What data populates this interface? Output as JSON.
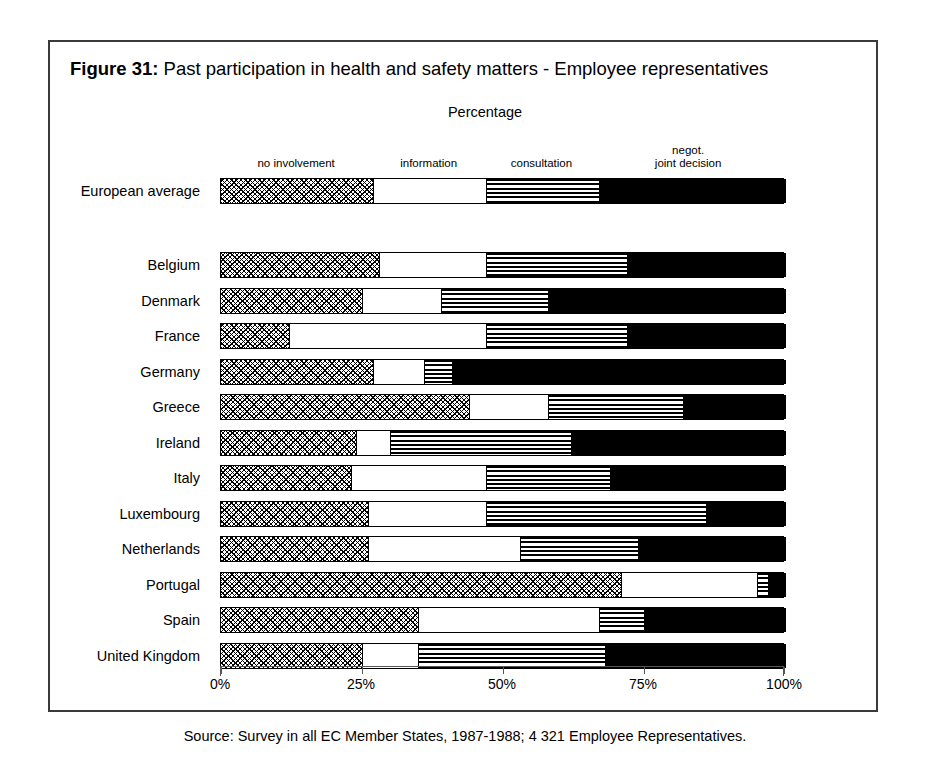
{
  "figure": {
    "number_label": "Figure 31:",
    "title": "Past participation in health and safety matters - Employee representatives",
    "axis_caption": "Percentage",
    "source": "Source: Survey in all EC Member States, 1987-1988; 4 321 Employee Representatives."
  },
  "chart_data": {
    "type": "bar",
    "orientation": "horizontal",
    "stacked": true,
    "title": "Figure 31: Past participation in health and safety matters - Employee representatives",
    "xlabel": "Percentage",
    "ylabel": "",
    "xlim": [
      0,
      100
    ],
    "grid": false,
    "legend_position": "top",
    "tick_labels": [
      "0%",
      "25%",
      "50%",
      "75%",
      "100%"
    ],
    "ticks": [
      0,
      25,
      50,
      75,
      100
    ],
    "series": [
      {
        "name": "no involvement",
        "pattern": "pat-dots",
        "label_lines": [
          "no involvement"
        ],
        "label_at": 13.5
      },
      {
        "name": "information",
        "pattern": "pat-white",
        "label_lines": [
          "information"
        ],
        "label_at": 37.0
      },
      {
        "name": "consultation",
        "pattern": "pat-hlines",
        "label_lines": [
          "consultation"
        ],
        "label_at": 57.0
      },
      {
        "name": "negot. joint decision",
        "pattern": "pat-black",
        "label_lines": [
          "negot.",
          "joint decision"
        ],
        "label_at": 83.0
      }
    ],
    "categories": [
      "European average",
      "Belgium",
      "Denmark",
      "France",
      "Germany",
      "Greece",
      "Ireland",
      "Italy",
      "Luxembourg",
      "Netherlands",
      "Portugal",
      "Spain",
      "United Kingdom"
    ],
    "rows": [
      {
        "category": "European average",
        "values": [
          27,
          20,
          20,
          33
        ],
        "group": "average"
      },
      {
        "category": "Belgium",
        "values": [
          28,
          19,
          25,
          28
        ],
        "group": "country"
      },
      {
        "category": "Denmark",
        "values": [
          25,
          14,
          19,
          42
        ],
        "group": "country"
      },
      {
        "category": "France",
        "values": [
          12,
          35,
          25,
          28
        ],
        "group": "country"
      },
      {
        "category": "Germany",
        "values": [
          27,
          9,
          5,
          59
        ],
        "group": "country"
      },
      {
        "category": "Greece",
        "values": [
          44,
          14,
          24,
          18
        ],
        "group": "country"
      },
      {
        "category": "Ireland",
        "values": [
          24,
          6,
          32,
          38
        ],
        "group": "country"
      },
      {
        "category": "Italy",
        "values": [
          23,
          24,
          22,
          31
        ],
        "group": "country"
      },
      {
        "category": "Luxembourg",
        "values": [
          26,
          21,
          39,
          14
        ],
        "group": "country"
      },
      {
        "category": "Netherlands",
        "values": [
          26,
          27,
          21,
          26
        ],
        "group": "country"
      },
      {
        "category": "Portugal",
        "values": [
          71,
          24,
          2,
          3
        ],
        "group": "country"
      },
      {
        "category": "Spain",
        "values": [
          35,
          32,
          8,
          25
        ],
        "group": "country"
      },
      {
        "category": "United Kingdom",
        "values": [
          25,
          10,
          33,
          32
        ],
        "group": "country"
      }
    ]
  }
}
